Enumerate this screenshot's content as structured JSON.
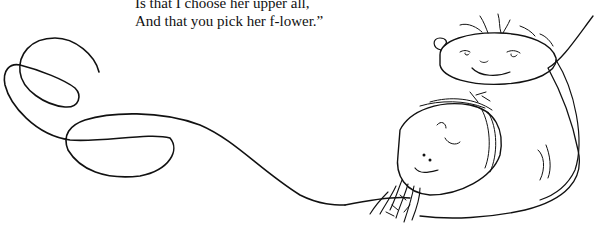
{
  "poem": {
    "lines": [
      "Is that I choose her upper all,",
      "And that you pick her f-lower.”"
    ]
  },
  "illustration": {
    "description": "Hand-drawn line: a looping swirl on the left that extends right into two cartoon faces (a smiling face upper right, a frowning face with a beard/flower lower middle)",
    "elements": [
      "swirl-line",
      "smiling-face",
      "frowning-face",
      "flower-tuft"
    ]
  }
}
